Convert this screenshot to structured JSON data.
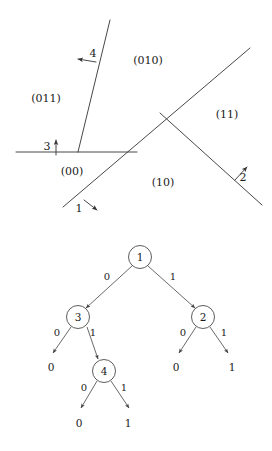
{
  "figure": {
    "panels": [
      "partition-diagram",
      "decision-tree"
    ]
  },
  "colors": {
    "line": "#333333",
    "text": "#1a1a1a",
    "background": "#ffffff",
    "node_fill": "#ffffff"
  },
  "partition": {
    "region_labels": [
      {
        "key": "r011",
        "text": "(011)",
        "x": 46,
        "y": 99
      },
      {
        "key": "r010",
        "text": "(010)",
        "x": 148,
        "y": 61
      },
      {
        "key": "r11",
        "text": "(11)",
        "x": 227,
        "y": 115
      },
      {
        "key": "r00",
        "text": "(00)",
        "x": 72,
        "y": 172
      },
      {
        "key": "r10",
        "text": "(10)",
        "x": 163,
        "y": 183
      }
    ],
    "split_labels": [
      {
        "key": "s1",
        "text": "1",
        "x": 79,
        "y": 209
      },
      {
        "key": "s2",
        "text": "2",
        "x": 243,
        "y": 178
      },
      {
        "key": "s3",
        "text": "3",
        "x": 47,
        "y": 147
      },
      {
        "key": "s4",
        "text": "4",
        "x": 93,
        "y": 54
      }
    ],
    "lines": [
      {
        "key": "split-1",
        "x1": 63,
        "y1": 207,
        "x2": 160,
        "y2": 113
      },
      {
        "key": "split-1-ext",
        "x1": 160,
        "y1": 113,
        "x2": 250,
        "y2": 48
      },
      {
        "key": "split-2",
        "x1": 160,
        "y1": 113,
        "x2": 262,
        "y2": 205
      },
      {
        "key": "split-3",
        "x1": 16,
        "y1": 152,
        "x2": 137,
        "y2": 152
      },
      {
        "key": "split-4",
        "x1": 110,
        "y1": 20,
        "x2": 78,
        "y2": 152
      }
    ]
  },
  "tree": {
    "nodes": [
      {
        "key": "n1",
        "label": "1",
        "x": 140,
        "y": 257,
        "r": 11.5
      },
      {
        "key": "n3",
        "label": "3",
        "x": 78,
        "y": 317,
        "r": 11.5
      },
      {
        "key": "n2",
        "label": "2",
        "x": 203,
        "y": 317,
        "r": 11.5
      },
      {
        "key": "n4",
        "label": "4",
        "x": 104,
        "y": 371,
        "r": 11.5
      }
    ],
    "edges": [
      {
        "key": "e-1-3",
        "from": "1",
        "to": "3",
        "label": "0",
        "x1": 132,
        "y1": 266,
        "x2": 86,
        "y2": 308,
        "lx": 107,
        "ly": 277
      },
      {
        "key": "e-1-2",
        "from": "1",
        "to": "2",
        "label": "1",
        "x1": 148,
        "y1": 266,
        "x2": 195,
        "y2": 308,
        "lx": 173,
        "ly": 277
      },
      {
        "key": "e-3-L",
        "from": "3",
        "to": "leaf0a",
        "label": "0",
        "x1": 71,
        "y1": 327,
        "x2": 52,
        "y2": 353,
        "lx": 57,
        "ly": 333
      },
      {
        "key": "e-3-4",
        "from": "3",
        "to": "4",
        "label": "1",
        "x1": 86,
        "y1": 327,
        "x2": 97,
        "y2": 361,
        "lx": 93,
        "ly": 333
      },
      {
        "key": "e-2-L",
        "from": "2",
        "to": "leaf0b",
        "label": "0",
        "x1": 196,
        "y1": 327,
        "x2": 178,
        "y2": 353,
        "lx": 183,
        "ly": 333
      },
      {
        "key": "e-2-R",
        "from": "2",
        "to": "leaf1b",
        "label": "1",
        "x1": 210,
        "y1": 327,
        "x2": 229,
        "y2": 353,
        "lx": 224,
        "ly": 333
      },
      {
        "key": "e-4-L",
        "from": "4",
        "to": "leaf0c",
        "label": "0",
        "x1": 97,
        "y1": 381,
        "x2": 80,
        "y2": 408,
        "lx": 84,
        "ly": 388
      },
      {
        "key": "e-4-R",
        "from": "4",
        "to": "leaf1c",
        "label": "1",
        "x1": 111,
        "y1": 381,
        "x2": 130,
        "y2": 408,
        "lx": 124,
        "ly": 388
      }
    ],
    "leaves": [
      {
        "key": "leaf0a",
        "label": "0",
        "x": 51,
        "y": 368
      },
      {
        "key": "leaf0b",
        "label": "0",
        "x": 176,
        "y": 368
      },
      {
        "key": "leaf1b",
        "label": "1",
        "x": 232,
        "y": 368
      },
      {
        "key": "leaf0c",
        "label": "0",
        "x": 79,
        "y": 424
      },
      {
        "key": "leaf1c",
        "label": "1",
        "x": 128,
        "y": 424
      }
    ]
  }
}
